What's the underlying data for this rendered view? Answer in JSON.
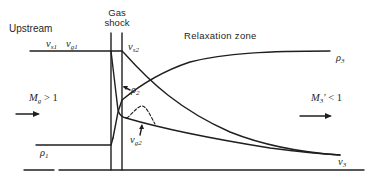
{
  "labels": {
    "upstream": "Upstream",
    "gas_shock_line1": "Gas",
    "gas_shock_line2": "shock",
    "relaxation_zone": "Relaxation zone",
    "vs1": {
      "base": "v",
      "sub": "s1"
    },
    "vg1": {
      "base": "v",
      "sub": "g1"
    },
    "vs2": {
      "base": "v",
      "sub": "s2"
    },
    "rho2": {
      "base": "ρ",
      "sub": "2"
    },
    "rho3": {
      "base": "ρ",
      "sub": "3"
    },
    "vg2": {
      "base": "v",
      "sub": "g2"
    },
    "rho1": {
      "base": "ρ",
      "sub": "1"
    },
    "v3": {
      "base": "v",
      "sub": "3"
    },
    "mach_upstream": {
      "base": "M",
      "sub": "g",
      "rest": " > 1"
    },
    "mach_downstream": {
      "base": "M",
      "sub": "3",
      "prime": "′",
      "rest": " < 1"
    }
  },
  "colors": {
    "line": "#1f1f1f",
    "background": "#ffffff"
  }
}
